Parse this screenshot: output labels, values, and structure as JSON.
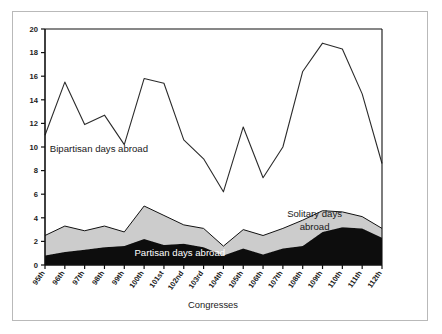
{
  "figure": {
    "frame_color": "#b9b9b9",
    "background": "#ffffff",
    "axis_color": "#111111"
  },
  "chart_data": {
    "type": "area",
    "title": "",
    "subtitle": "",
    "xlabel": "Congresses",
    "ylabel": "",
    "grid": false,
    "legend_position": "inline-annotations",
    "xlim": [
      0,
      17
    ],
    "ylim": [
      0,
      20
    ],
    "ytick_step": 2,
    "yticks": [
      0,
      2,
      4,
      6,
      8,
      10,
      12,
      14,
      16,
      18,
      20
    ],
    "ytick_labels": [
      "0",
      "2",
      "4",
      "6",
      "8",
      "10",
      "12",
      "14",
      "16",
      "18",
      "20"
    ],
    "categories": [
      "95th",
      "96th",
      "97th",
      "98th",
      "99th",
      "100th",
      "101st",
      "102nd",
      "103rd",
      "104th",
      "105th",
      "106th",
      "107th",
      "108th",
      "109th",
      "110th",
      "111th",
      "112th"
    ],
    "series": [
      {
        "name": "Partisan days abroad",
        "render": "area-stacked",
        "color": "#0d0d0d",
        "values": [
          0.8,
          1.1,
          1.3,
          1.5,
          1.6,
          2.2,
          1.7,
          1.8,
          1.5,
          0.8,
          1.4,
          0.9,
          1.4,
          1.6,
          2.8,
          3.2,
          3.1,
          2.3
        ]
      },
      {
        "name": "Solitary days abroad",
        "render": "area-stacked",
        "color": "#cccccc",
        "values": [
          1.7,
          2.2,
          1.6,
          1.8,
          1.2,
          2.8,
          2.5,
          1.6,
          1.6,
          0.8,
          1.6,
          1.6,
          1.7,
          2.2,
          1.8,
          1.3,
          1.0,
          0.8
        ]
      },
      {
        "name": "Bipartisan days abroad",
        "render": "line",
        "color": "#2b2b2b",
        "values": [
          11.0,
          15.5,
          11.9,
          12.7,
          10.2,
          15.8,
          15.4,
          10.6,
          9.0,
          6.2,
          11.7,
          7.4,
          10.0,
          16.4,
          18.8,
          18.3,
          14.5,
          8.6
        ]
      }
    ],
    "annotations": [
      {
        "text": "Bipartisan days abroad",
        "x_frac": 0.16,
        "value": 9.6,
        "color": "#1a1a1a"
      },
      {
        "text": "Partisan days abroad",
        "x_frac": 0.4,
        "value": 0.8,
        "color": "#ffffff"
      },
      {
        "text": "Solitary days",
        "x_frac": 0.8,
        "value": 4.1,
        "color": "#1a1a1a"
      },
      {
        "text": "abroad",
        "x_frac": 0.8,
        "value": 3.0,
        "color": "#1a1a1a"
      }
    ]
  }
}
